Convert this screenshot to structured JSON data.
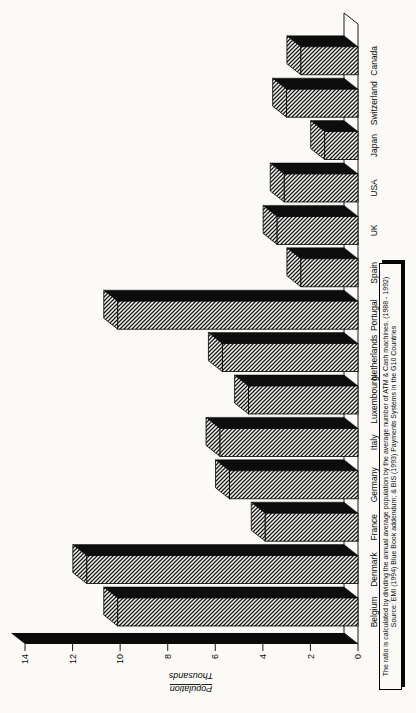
{
  "page": {
    "kind": "scanned chart page",
    "rotation": "chart drawn landscape, rotated 90 degrees counterclockwise on portrait page",
    "background_color": "#f7f6f3"
  },
  "chart_data": {
    "type": "bar",
    "style": "3d-oblique-columns-hatched",
    "title": "",
    "categories": [
      "Belgium",
      "Denmark",
      "France",
      "Germany",
      "Italy",
      "Luxembourg",
      "Netherlands",
      "Portugal",
      "Spain",
      "UK",
      "USA",
      "Japan",
      "Switzerland",
      "Canada"
    ],
    "values": [
      10.1,
      11.4,
      3.9,
      5.4,
      5.8,
      4.6,
      5.7,
      10.1,
      2.4,
      3.4,
      3.1,
      1.4,
      3.0,
      2.4
    ],
    "xlabel": "",
    "ylabel": "Population Thousands",
    "ylabel_lines": [
      "Population",
      "Thousands"
    ],
    "y_ticks": [
      0,
      2,
      4,
      6,
      8,
      10,
      12,
      14
    ],
    "ylim": [
      0,
      14
    ],
    "grid": false,
    "legend": false,
    "bar_front_fill": "diagonal-hatch",
    "bar_side_color": "#0d0d0d",
    "wall_color": "#0b0b0b",
    "floor_color": "#fcfbf9",
    "outline_color": "#000000"
  },
  "footnote": {
    "line1": "The ratio is calculated by dividing the annual average population by the average number of ATM & Cash machines. (1988 - 1992)",
    "line2": "Source: EMI (1994) Blue Book addendum; & BIS (1993) Payments Systems in the G10 Countries"
  }
}
